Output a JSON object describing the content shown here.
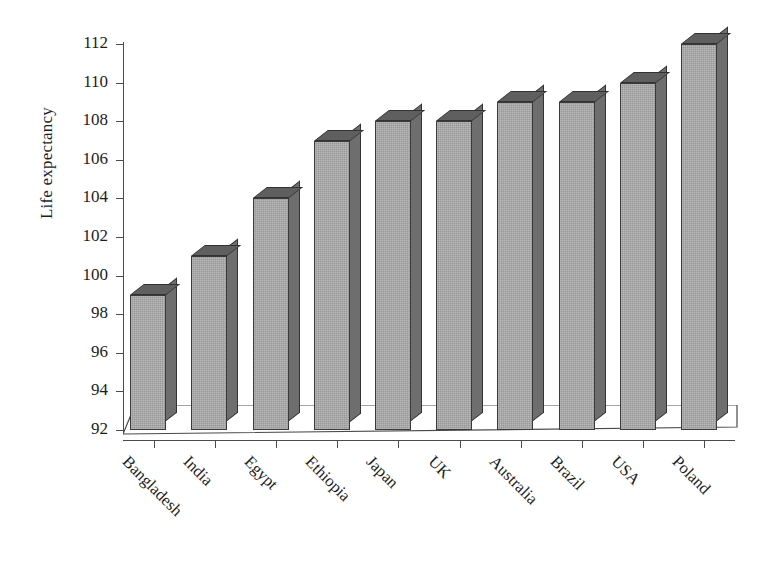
{
  "chart_data": {
    "type": "bar",
    "title": "",
    "subtitle": "",
    "xlabel": "",
    "ylabel": "Life expectancy",
    "categories": [
      "Bangladesh",
      "India",
      "Egypt",
      "Ethiopia",
      "Japan",
      "UK",
      "Australia",
      "Brazil",
      "USA",
      "Poland"
    ],
    "values": [
      99,
      101,
      104,
      107,
      108,
      108,
      109,
      109,
      110,
      112
    ],
    "ylim": [
      92,
      112
    ],
    "ytick_step": 2,
    "ytick_labels": [
      "112",
      "110",
      "108",
      "106",
      "104",
      "102",
      "100",
      "98",
      "96",
      "94",
      "92"
    ],
    "ytick_values": [
      112,
      110,
      108,
      106,
      104,
      102,
      100,
      98,
      96,
      94,
      92
    ],
    "grid": false,
    "legend": null,
    "legend_position": "none",
    "annotations": [],
    "style": {
      "three_d": true,
      "bar_face_color": "#989898",
      "bar_side_color": "#6e6e6e",
      "bar_top_color": "#5f5f5f",
      "bar_edge_color": "#333333",
      "axis_color": "#4a4a4a",
      "text_color": "#1d1d1d",
      "background_color": "#ffffff"
    }
  }
}
